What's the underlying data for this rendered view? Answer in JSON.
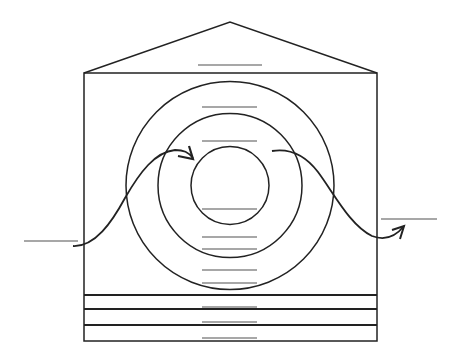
{
  "diagram": {
    "type": "blank-labeled-schematic",
    "colors": {
      "ink": "#222222",
      "label_line": "#8a8a8a",
      "background": "#ffffff"
    },
    "roof": {
      "apex": [
        230,
        22
      ],
      "left": [
        84,
        73
      ],
      "right": [
        377,
        73
      ]
    },
    "frame": {
      "x": 84,
      "y": 73,
      "width": 293,
      "height": 268
    },
    "circles": [
      {
        "name": "outer",
        "cx": 230,
        "cy": 185.5,
        "r": 104
      },
      {
        "name": "middle",
        "cx": 230,
        "cy": 185.5,
        "r": 72
      },
      {
        "name": "inner",
        "cx": 230,
        "cy": 185.5,
        "r": 39
      }
    ],
    "bands_y": [
      295,
      309,
      325
    ],
    "label_lines": [
      {
        "name": "roof-label",
        "x1": 198,
        "x2": 262,
        "y": 65
      },
      {
        "name": "outer-ring-label",
        "x1": 202,
        "x2": 257,
        "y": 107
      },
      {
        "name": "middle-ring-label",
        "x1": 202,
        "x2": 257,
        "y": 141
      },
      {
        "name": "inner-circle-label",
        "x1": 202,
        "x2": 257,
        "y": 209
      },
      {
        "name": "middle-ring-lower-label",
        "x1": 202,
        "x2": 257,
        "y": 237
      },
      {
        "name": "outer-ring-lower-label",
        "x1": 202,
        "x2": 257,
        "y": 249
      },
      {
        "name": "outer-ring-bottom-label",
        "x1": 202,
        "x2": 257,
        "y": 270
      },
      {
        "name": "outer-ring-base-label",
        "x1": 202,
        "x2": 257,
        "y": 283
      },
      {
        "name": "band-1-label",
        "x1": 202,
        "x2": 257,
        "y": 307
      },
      {
        "name": "band-2-label",
        "x1": 202,
        "x2": 257,
        "y": 322
      },
      {
        "name": "band-3-label",
        "x1": 202,
        "x2": 257,
        "y": 338
      },
      {
        "name": "left-input-label",
        "x1": 24,
        "x2": 78,
        "y": 241
      },
      {
        "name": "right-output-label",
        "x1": 381,
        "x2": 437,
        "y": 219
      }
    ],
    "arrows": [
      {
        "name": "incoming-arrow",
        "direction": "into inner circle"
      },
      {
        "name": "outgoing-arrow",
        "direction": "out of frame to right"
      }
    ],
    "text_labels": []
  }
}
